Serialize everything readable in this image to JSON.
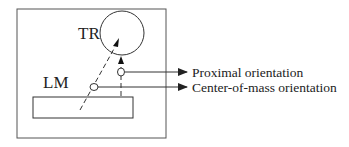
{
  "diagram": {
    "labels": {
      "trajector": "TR",
      "landmark": "LM"
    },
    "annotations": [
      {
        "id": "proximal",
        "text": "Proximal orientation"
      },
      {
        "id": "center_of_mass",
        "text": "Center-of-mass orientation"
      }
    ],
    "colors": {
      "stroke": "#333333",
      "text": "#222222",
      "background": "#ffffff"
    }
  }
}
